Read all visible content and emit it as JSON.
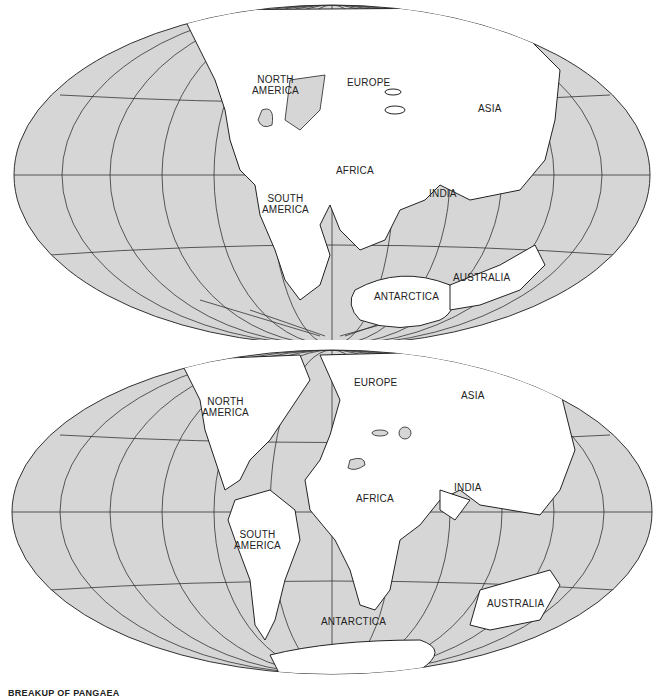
{
  "maps": [
    {
      "id": "upper",
      "labels": {
        "north_america": "NORTH\nAMERICA",
        "europe": "EUROPE",
        "asia": "ASIA",
        "africa": "AFRICA",
        "india": "INDIA",
        "south_america": "SOUTH\nAMERICA",
        "antarctica": "ANTARCTICA",
        "australia": "AUSTRALIA"
      }
    },
    {
      "id": "lower",
      "labels": {
        "north_america": "NORTH\nAMERICA",
        "europe": "EUROPE",
        "asia": "ASIA",
        "africa": "AFRICA",
        "india": "INDIA",
        "south_america": "SOUTH\nAMERICA",
        "antarctica": "ANTARCTICA",
        "australia": "AUSTRALIA"
      }
    }
  ],
  "caption": "BREAKUP OF PANGAEA",
  "colors": {
    "ocean": "#d6d6d6",
    "land": "#ffffff",
    "grid": "#333333",
    "outline": "#222222"
  }
}
